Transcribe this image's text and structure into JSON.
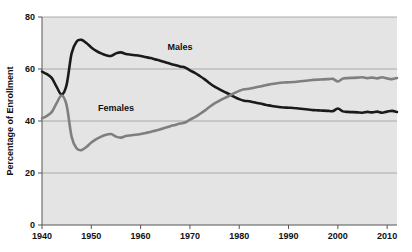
{
  "chart_data": {
    "type": "line",
    "title": "",
    "xlabel": "",
    "ylabel": "Percentage of Enrollment",
    "xlim": [
      1940,
      2012
    ],
    "ylim": [
      0,
      80
    ],
    "ytick_values": [
      0,
      20,
      40,
      60,
      80
    ],
    "ytick_labels": [
      "0",
      "20",
      "40",
      "60",
      "80"
    ],
    "xtick_values": [
      1940,
      1950,
      1960,
      1970,
      1980,
      1990,
      2000,
      2010
    ],
    "xtick_labels": [
      "1940",
      "1950",
      "1960",
      "1970",
      "1980",
      "1990",
      "2000",
      "2010"
    ],
    "grid": "horizontal",
    "legend_position": "inline-annotations",
    "plot_background": "#e4e4e4",
    "figure_background": "#ffffff",
    "series": [
      {
        "name": "Males",
        "color": "#1a1a1a",
        "label_annotation": "Males",
        "x": [
          1940,
          1941,
          1942,
          1943,
          1944,
          1945,
          1946,
          1947,
          1948,
          1949,
          1950,
          1951,
          1952,
          1953,
          1954,
          1955,
          1956,
          1957,
          1958,
          1959,
          1960,
          1961,
          1962,
          1963,
          1964,
          1965,
          1966,
          1967,
          1968,
          1969,
          1970,
          1971,
          1972,
          1973,
          1974,
          1975,
          1976,
          1977,
          1978,
          1979,
          1980,
          1981,
          1982,
          1983,
          1984,
          1985,
          1986,
          1987,
          1988,
          1989,
          1990,
          1991,
          1992,
          1993,
          1994,
          1995,
          1996,
          1997,
          1998,
          1999,
          2000,
          2001,
          2002,
          2003,
          2004,
          2005,
          2006,
          2007,
          2008,
          2009,
          2010,
          2011,
          2012
        ],
        "values": [
          59.0,
          58.0,
          56.5,
          53.0,
          50.2,
          54.0,
          66.0,
          70.5,
          71.2,
          70.0,
          68.3,
          67.0,
          66.0,
          65.3,
          65.0,
          66.0,
          66.4,
          65.8,
          65.5,
          65.3,
          65.0,
          64.6,
          64.2,
          63.7,
          63.2,
          62.6,
          62.0,
          61.5,
          61.0,
          60.6,
          59.5,
          58.5,
          57.3,
          56.0,
          54.5,
          53.2,
          52.2,
          51.2,
          50.3,
          49.3,
          48.4,
          47.8,
          47.6,
          47.2,
          46.8,
          46.4,
          46.0,
          45.7,
          45.4,
          45.2,
          45.1,
          45.0,
          44.8,
          44.6,
          44.4,
          44.2,
          44.1,
          44.0,
          43.9,
          43.8,
          44.8,
          43.7,
          43.5,
          43.4,
          43.3,
          43.2,
          43.5,
          43.3,
          43.6,
          43.2,
          43.6,
          43.9,
          43.5
        ]
      },
      {
        "name": "Females",
        "color": "#7f7f7f",
        "label_annotation": "Females",
        "x": [
          1940,
          1941,
          1942,
          1943,
          1944,
          1945,
          1946,
          1947,
          1948,
          1949,
          1950,
          1951,
          1952,
          1953,
          1954,
          1955,
          1956,
          1957,
          1958,
          1959,
          1960,
          1961,
          1962,
          1963,
          1964,
          1965,
          1966,
          1967,
          1968,
          1969,
          1970,
          1971,
          1972,
          1973,
          1974,
          1975,
          1976,
          1977,
          1978,
          1979,
          1980,
          1981,
          1982,
          1983,
          1984,
          1985,
          1986,
          1987,
          1988,
          1989,
          1990,
          1991,
          1992,
          1993,
          1994,
          1995,
          1996,
          1997,
          1998,
          1999,
          2000,
          2001,
          2002,
          2003,
          2004,
          2005,
          2006,
          2007,
          2008,
          2009,
          2010,
          2011,
          2012
        ],
        "values": [
          41.0,
          42.0,
          43.5,
          47.0,
          49.8,
          46.0,
          34.0,
          29.5,
          28.8,
          30.0,
          31.7,
          33.0,
          34.0,
          34.7,
          35.0,
          34.0,
          33.6,
          34.2,
          34.5,
          34.7,
          35.0,
          35.4,
          35.8,
          36.3,
          36.8,
          37.4,
          38.0,
          38.5,
          39.0,
          39.4,
          40.5,
          41.5,
          42.7,
          44.0,
          45.5,
          46.8,
          47.8,
          48.8,
          49.7,
          50.7,
          51.6,
          52.2,
          52.4,
          52.8,
          53.2,
          53.6,
          54.0,
          54.3,
          54.6,
          54.8,
          54.9,
          55.0,
          55.2,
          55.4,
          55.6,
          55.8,
          55.9,
          56.0,
          56.1,
          56.2,
          55.2,
          56.3,
          56.5,
          56.6,
          56.7,
          56.8,
          56.5,
          56.7,
          56.4,
          56.8,
          56.4,
          56.1,
          56.5
        ]
      }
    ],
    "annotations": [
      {
        "text": "Males",
        "x": 1968,
        "y": 67.5
      },
      {
        "text": "Females",
        "x": 1955,
        "y": 44.0
      }
    ]
  }
}
